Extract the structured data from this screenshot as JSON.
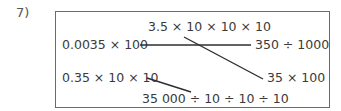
{
  "question": {
    "number_label": "7)"
  },
  "matching": {
    "expressions": {
      "top_center": "3.5 × 10 × 10 × 10",
      "left_1": "0.0035 × 100",
      "right_1": "350 ÷ 1000",
      "left_2": "0.35 × 10 × 10",
      "right_2": "35 × 100",
      "bottom_center": "35 000 ÷ 10 ÷ 10 ÷ 10"
    },
    "connections": [
      {
        "from": "0.0035 × 100",
        "to": "350 ÷ 1000"
      },
      {
        "from": "3.5 × 10 × 10 × 10",
        "to": "35 × 100"
      },
      {
        "from": "0.35 × 10 × 10",
        "to": "35 000 ÷ 10 ÷ 10 ÷ 10"
      }
    ]
  }
}
